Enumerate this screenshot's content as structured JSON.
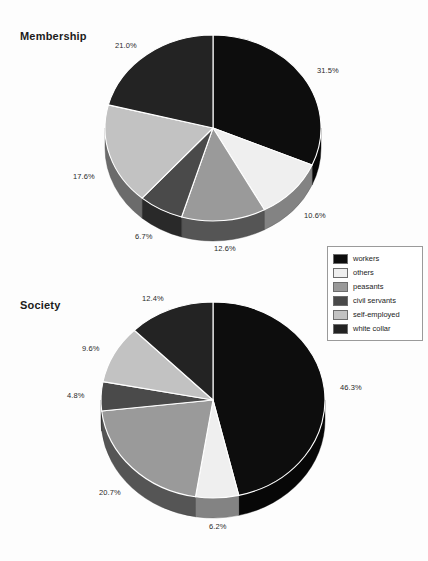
{
  "legend": {
    "name": "chart-legend",
    "items": [
      {
        "label": "workers",
        "color": "#0d0d0d"
      },
      {
        "label": "others",
        "color": "#efefef"
      },
      {
        "label": "peasants",
        "color": "#9a9a9a"
      },
      {
        "label": "civil servants",
        "color": "#4a4a4a"
      },
      {
        "label": "self-employed",
        "color": "#c2c2c2"
      },
      {
        "label": "white collar",
        "color": "#232323"
      }
    ]
  },
  "charts": [
    {
      "title": "Membership",
      "labels": [
        "31.5%",
        "10.6%",
        "12.6%",
        "6.7%",
        "17.6%",
        "21.0%"
      ]
    },
    {
      "title": "Society",
      "labels": [
        "46.3%",
        "6.2%",
        "20.7%",
        "4.8%",
        "9.6%",
        "12.4%"
      ]
    }
  ],
  "chart_data": [
    {
      "type": "pie",
      "title": "Membership",
      "categories": [
        "workers",
        "others",
        "peasants",
        "civil servants",
        "self-employed",
        "white collar"
      ],
      "values": [
        31.5,
        10.6,
        12.6,
        6.7,
        17.6,
        21.0
      ],
      "value_labels": [
        "31.5%",
        "10.6%",
        "12.6%",
        "6.7%",
        "17.6%",
        "21.0%"
      ],
      "colors": [
        "#0d0d0d",
        "#efefef",
        "#9a9a9a",
        "#4a4a4a",
        "#c2c2c2",
        "#232323"
      ],
      "start_angle": 0,
      "direction": "clockwise",
      "style": "3d-pie",
      "legend_position": "right",
      "xlabel": "",
      "ylabel": ""
    },
    {
      "type": "pie",
      "title": "Society",
      "categories": [
        "workers",
        "others",
        "peasants",
        "civil servants",
        "self-employed",
        "white collar"
      ],
      "values": [
        46.3,
        6.2,
        20.7,
        4.8,
        9.6,
        12.4
      ],
      "value_labels": [
        "46.3%",
        "6.2%",
        "20.7%",
        "4.8%",
        "9.6%",
        "12.4%"
      ],
      "colors": [
        "#0d0d0d",
        "#efefef",
        "#9a9a9a",
        "#4a4a4a",
        "#c2c2c2",
        "#232323"
      ],
      "start_angle": 0,
      "direction": "clockwise",
      "style": "3d-pie",
      "legend_position": "right",
      "xlabel": "",
      "ylabel": ""
    }
  ]
}
